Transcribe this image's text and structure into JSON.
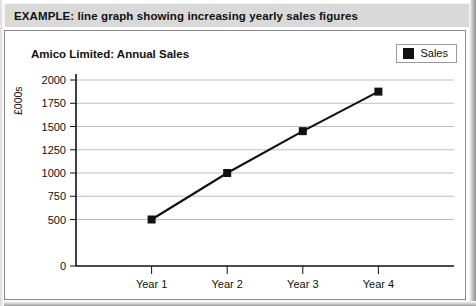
{
  "caption": {
    "text": "EXAMPLE: line graph showing increasing yearly sales figures"
  },
  "chart_data": {
    "type": "line",
    "title": "Amico Limited: Annual Sales",
    "xlabel": "",
    "ylabel": "£000s",
    "categories": [
      "Year 1",
      "Year 2",
      "Year 3",
      "Year 4"
    ],
    "series": [
      {
        "name": "Sales",
        "values": [
          500,
          1000,
          1450,
          1875
        ],
        "color": "#111111",
        "marker": "square"
      }
    ],
    "ylim": [
      0,
      2000
    ],
    "yticks": [
      0,
      500,
      750,
      1000,
      1250,
      1500,
      1750,
      2000
    ],
    "ytick_labels": [
      "0",
      "500",
      "750",
      "1000",
      "1250",
      "1500",
      "1750",
      "2000"
    ],
    "grid": true,
    "grid_color": "#bfbfbf",
    "legend_position": "top-right",
    "legend_entries": [
      "Sales"
    ]
  }
}
